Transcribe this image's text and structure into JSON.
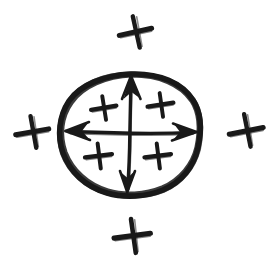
{
  "figure": {
    "title": "Hand-drawn sketch of an ellipse with internal plus signs and a four-way double-headed arrow, surrounded by four external plus signs",
    "background_color": "#ffffff",
    "ink_color": "#191919",
    "width": 280,
    "height": 267,
    "style": "hand-drawn pen sketch"
  },
  "chart_data": {
    "type": "diagram",
    "title": "",
    "elements": [
      {
        "name": "ellipse-outline",
        "kind": "ellipse",
        "cx": 130,
        "cy": 135,
        "rx": 70,
        "ry": 62,
        "stroke_width": 5,
        "label": ""
      },
      {
        "name": "arrow-up",
        "kind": "double-arrow-segment",
        "direction": "up",
        "from": [
          130,
          135
        ],
        "to": [
          131,
          76
        ],
        "label": ""
      },
      {
        "name": "arrow-down",
        "kind": "double-arrow-segment",
        "direction": "down",
        "from": [
          130,
          135
        ],
        "to": [
          127,
          192
        ],
        "label": ""
      },
      {
        "name": "arrow-left",
        "kind": "double-arrow-segment",
        "direction": "left",
        "from": [
          130,
          133
        ],
        "to": [
          66,
          131
        ],
        "label": ""
      },
      {
        "name": "arrow-right",
        "kind": "double-arrow-segment",
        "direction": "right",
        "from": [
          130,
          133
        ],
        "to": [
          196,
          132
        ],
        "label": ""
      }
    ],
    "inner_plus_signs": [
      {
        "name": "inner-plus-top-left",
        "x": 104,
        "y": 108,
        "size": 24,
        "rotation": -6
      },
      {
        "name": "inner-plus-top-right",
        "x": 161,
        "y": 105,
        "size": 24,
        "rotation": -5
      },
      {
        "name": "inner-plus-bottom-left",
        "x": 99,
        "y": 156,
        "size": 24,
        "rotation": -4
      },
      {
        "name": "inner-plus-bottom-right",
        "x": 158,
        "y": 156,
        "size": 24,
        "rotation": -4
      }
    ],
    "outer_plus_signs": [
      {
        "name": "outer-plus-top",
        "x": 136,
        "y": 32,
        "size": 30,
        "rotation": -8
      },
      {
        "name": "outer-plus-left",
        "x": 33,
        "y": 132,
        "size": 30,
        "rotation": -6
      },
      {
        "name": "outer-plus-right",
        "x": 247,
        "y": 131,
        "size": 30,
        "rotation": -7
      },
      {
        "name": "outer-plus-bottom",
        "x": 133,
        "y": 236,
        "size": 30,
        "rotation": -4
      }
    ],
    "counts": {
      "inner_plus_count": 4,
      "outer_plus_count": 4,
      "arrow_count": 4
    },
    "xlabel": "",
    "ylabel": "",
    "annotations": [],
    "legend": []
  }
}
